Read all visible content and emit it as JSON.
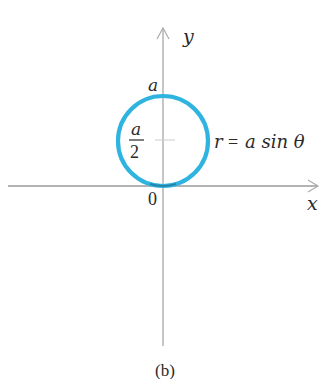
{
  "figure": {
    "caption": "(b)",
    "axes": {
      "x_label": "x",
      "y_label": "y",
      "origin_label": "0",
      "axis_color": "#9a9a9a"
    },
    "curve": {
      "equation_lhs": "r",
      "equation_eq": "=",
      "equation_rhs": "a sin θ",
      "color": "#2fb4e0",
      "shape": "circle"
    },
    "labels": {
      "top": "a",
      "half_num": "a",
      "half_den": "2"
    }
  }
}
